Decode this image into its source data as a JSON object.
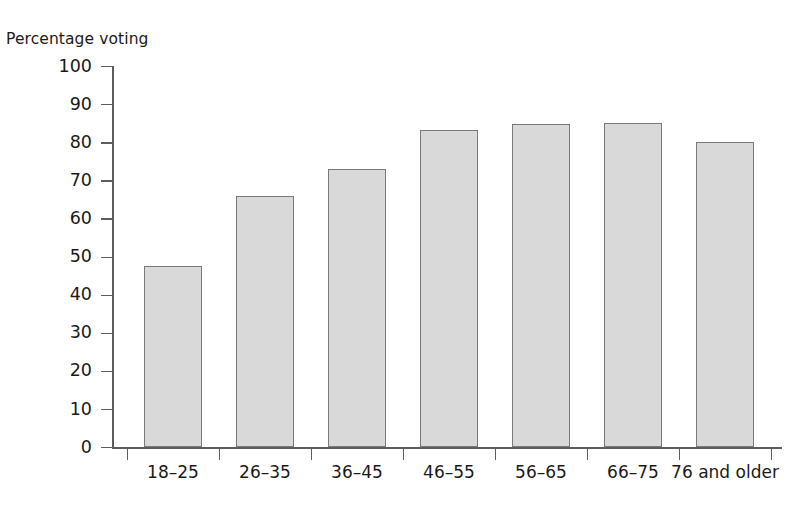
{
  "chart_data": {
    "type": "bar",
    "title": "",
    "xlabel": "",
    "ylabel": "Percentage voting",
    "ylim": [
      0,
      100
    ],
    "yticks": [
      0,
      10,
      20,
      30,
      40,
      50,
      60,
      70,
      80,
      90,
      100
    ],
    "grid": false,
    "legend": null,
    "categories": [
      "18–25",
      "26–35",
      "36–45",
      "46–55",
      "56–65",
      "66–75",
      "76 and older"
    ],
    "values": [
      47.5,
      65.8,
      73,
      83.3,
      84.7,
      85,
      80
    ],
    "bar_color": "#d9d9d9",
    "bar_edge_color": "#7a7a7a",
    "axis_color": "#5d5d5d",
    "text_color": "#1a1a1a"
  }
}
